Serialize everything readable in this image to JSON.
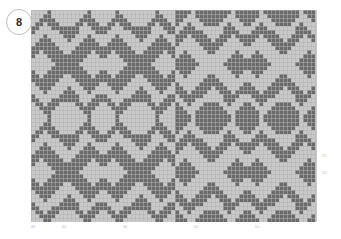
{
  "figure": {
    "title": "",
    "badge_label": "8"
  },
  "axes": {
    "x_ticks": [
      {
        "label": "44",
        "pos_px": 33
      },
      {
        "label": "40",
        "pos_px": 64
      },
      {
        "label": "30",
        "pos_px": 125
      },
      {
        "label": "20",
        "pos_px": 196
      },
      {
        "label": "10",
        "pos_px": 257
      }
    ],
    "y_ticks": [
      {
        "label": "11",
        "pos_px": 155
      },
      {
        "label": "10",
        "pos_px": 172
      }
    ]
  },
  "colors": {
    "dark": "#6a6a6a",
    "light": "#c9c9c9",
    "gridline": "#b0b0b0",
    "badge_border": "#bdbdbd",
    "tick_text": "#b9b9b9",
    "background": "#ffffff"
  },
  "chart_data": {
    "type": "heatmap",
    "title": "",
    "xlabel": "",
    "ylabel": "",
    "cell_size_px": 4,
    "cols": 71,
    "rows": 53,
    "value_labels": {
      "0": "light",
      "1": "dark"
    },
    "legend": [
      {
        "name": "dark stitch",
        "value": 1,
        "color": "#6a6a6a"
      },
      {
        "name": "light stitch",
        "value": 0,
        "color": "#c9c9c9"
      }
    ],
    "motif": {
      "kind": "snowflake",
      "tile_cols": 36,
      "tile_rows": 27,
      "symmetry": "4-fold mirrored within tile; right half inverted",
      "repeats_x": 2,
      "repeats_y": 2
    },
    "grid": true,
    "legend_position": "none",
    "xlim": [
      0,
      71
    ],
    "ylim": [
      0,
      53
    ],
    "tile_matrix_36x27": [
      "000010000000001000000100000000010000",
      "000110000000011000000110000000011000",
      "001111000000111100001111000000111100",
      "011011100001101110011011100001101110",
      "110001111111000111110001111111000111",
      "100000011111000011100000011111000011",
      "000100001110001000000100001110001000",
      "001110000100011100001110000100011100",
      "011111000000111110011111000000111110",
      "111111100001111111111111100001111111",
      "110111110011111011110111110011111011",
      "100011111111110001100011111111110001",
      "000001111111100000000001111111100000",
      "000000111111000000000000111111000000",
      "000001111111100000000001111111100000",
      "100011111111110001100011111111110001",
      "110111110011111011110111110011111011",
      "111111100001111111111111100001111111",
      "011111000000111110011111000000111110",
      "001110000100011100001110000100011100",
      "000100001110001000000100001110001000",
      "100000011111000011100000011111000011",
      "110001111111000111110001111111000111",
      "011011100001101110011011100001101110",
      "001111000000111100001111000000111100",
      "000110000000011000000110000000011000",
      "000010000000001000000100000000010000"
    ]
  }
}
